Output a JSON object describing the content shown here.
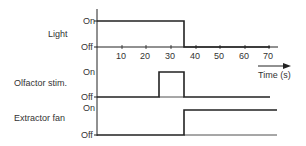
{
  "diagram": {
    "time_axis": {
      "label": "Time (s)",
      "ticks": [
        "10",
        "20",
        "30",
        "40",
        "50",
        "60",
        "70"
      ],
      "tick_values": [
        10,
        20,
        30,
        40,
        50,
        60,
        70
      ],
      "range": [
        0,
        73
      ]
    },
    "state_labels": {
      "on": "On",
      "off": "Off"
    },
    "channels": [
      {
        "name": "Light",
        "on_from": 0,
        "on_to": 35
      },
      {
        "name": "Olfactor stim.",
        "on_from": 25,
        "on_to": 35
      },
      {
        "name": "Extractor fan",
        "on_from": 35,
        "on_to": 73
      }
    ],
    "colors": {
      "line": "#222222",
      "text": "#333333"
    }
  }
}
